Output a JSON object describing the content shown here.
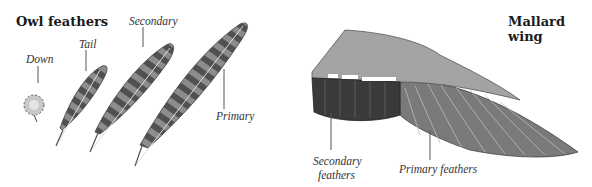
{
  "left_panel": {
    "title": "Owl feathers",
    "labels": {
      "down": "Down",
      "tail": "Tail",
      "secondary": "Secondary",
      "primary": "Primary"
    }
  },
  "right_panel": {
    "title": "Mallard wing",
    "labels": {
      "secondary_line1": "Secondary",
      "secondary_line2": "feathers",
      "primary": "Primary feathers"
    }
  },
  "colors": {
    "owl_feather_dark": "#555555",
    "owl_feather_light": "#8c8c8c",
    "wing_coverts": "#a3a3a3",
    "wing_speculum": "#3a3a3a",
    "wing_primaries": "#7a7a7a"
  }
}
